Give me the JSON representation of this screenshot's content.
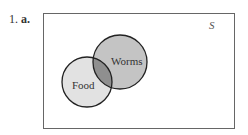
{
  "problem": {
    "number": "1.",
    "part": "a."
  },
  "diagram": {
    "universe_label": "S",
    "sets": [
      {
        "name": "Food",
        "cx": 87,
        "cy": 82,
        "r": 25,
        "fill": "#e2e2e2"
      },
      {
        "name": "Worms",
        "cx": 120,
        "cy": 62,
        "r": 27,
        "fill": "#c4c4c4"
      }
    ],
    "intersection_fill": "#8f8f8f",
    "stroke": "#222222"
  }
}
